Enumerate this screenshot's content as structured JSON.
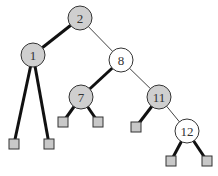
{
  "diagram": {
    "type": "red-black-tree",
    "colors": {
      "gray_node": "#cfcfcf",
      "white_node": "#ffffff",
      "leaf_fill": "#c8c8c8",
      "stroke": "#333333",
      "thick_edge": "#111111",
      "thin_edge": "#444444"
    },
    "nodes": [
      {
        "id": "n2",
        "label": "2",
        "x": 80,
        "y": 18,
        "fill": "gray"
      },
      {
        "id": "n1",
        "label": "1",
        "x": 33,
        "y": 55,
        "fill": "gray"
      },
      {
        "id": "n8",
        "label": "8",
        "x": 121,
        "y": 60,
        "fill": "white"
      },
      {
        "id": "n7",
        "label": "7",
        "x": 81,
        "y": 97,
        "fill": "gray"
      },
      {
        "id": "n11",
        "label": "11",
        "x": 159,
        "y": 97,
        "fill": "gray"
      },
      {
        "id": "n12",
        "label": "12",
        "x": 187,
        "y": 131,
        "fill": "white"
      }
    ],
    "leaves": [
      {
        "id": "l1",
        "x": 14,
        "y": 144
      },
      {
        "id": "l2",
        "x": 49,
        "y": 144
      },
      {
        "id": "l3",
        "x": 63,
        "y": 122
      },
      {
        "id": "l4",
        "x": 98,
        "y": 122
      },
      {
        "id": "l5",
        "x": 136,
        "y": 127
      },
      {
        "id": "l6",
        "x": 171,
        "y": 161
      },
      {
        "id": "l7",
        "x": 207,
        "y": 161
      }
    ],
    "edges": [
      {
        "from": "n2",
        "to": "n1",
        "style": "thick"
      },
      {
        "from": "n2",
        "to": "n8",
        "style": "thin"
      },
      {
        "from": "n1",
        "to": "l1",
        "style": "thick"
      },
      {
        "from": "n1",
        "to": "l2",
        "style": "thick"
      },
      {
        "from": "n8",
        "to": "n7",
        "style": "thick"
      },
      {
        "from": "n8",
        "to": "n11",
        "style": "thin"
      },
      {
        "from": "n7",
        "to": "l3",
        "style": "thick"
      },
      {
        "from": "n7",
        "to": "l4",
        "style": "thick"
      },
      {
        "from": "n11",
        "to": "l5",
        "style": "thick"
      },
      {
        "from": "n11",
        "to": "n12",
        "style": "thin"
      },
      {
        "from": "n12",
        "to": "l6",
        "style": "thick"
      },
      {
        "from": "n12",
        "to": "l7",
        "style": "thick"
      }
    ]
  }
}
